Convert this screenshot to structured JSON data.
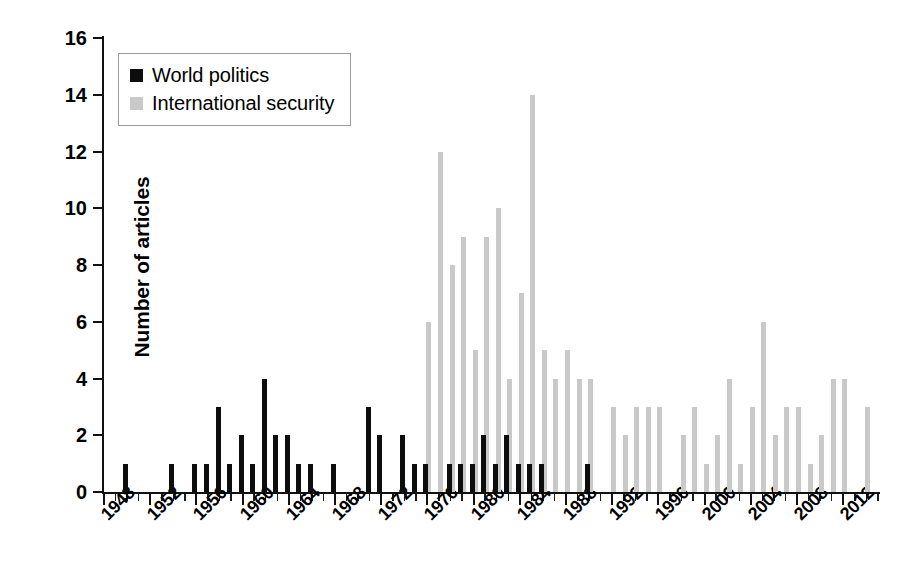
{
  "chart_data": {
    "type": "bar",
    "title": "",
    "xlabel": "",
    "ylabel": "Number of articles",
    "ylim": [
      0,
      16
    ],
    "ytick_values": [
      0,
      2,
      4,
      6,
      8,
      10,
      12,
      14,
      16
    ],
    "ytick_labels": [
      "0",
      "2",
      "4",
      "6",
      "8",
      "10",
      "12",
      "14",
      "16"
    ],
    "xlim": [
      1948,
      2015
    ],
    "xtick_labels": [
      "1948",
      "1952",
      "1956",
      "1960",
      "1964",
      "1968",
      "1972",
      "1976",
      "1980",
      "1984",
      "1988",
      "1992",
      "1996",
      "2000",
      "2004",
      "2008",
      "2012"
    ],
    "xtick_values": [
      1948,
      1952,
      1956,
      1960,
      1964,
      1968,
      1972,
      1976,
      1980,
      1984,
      1988,
      1992,
      1996,
      2000,
      2004,
      2008,
      2012
    ],
    "xtick_minor_step": 1,
    "grid": false,
    "legend_position": "upper-left-inside",
    "colors": {
      "world_politics": "#0d0d0d",
      "international_security": "#c9c9c9",
      "axis": "#111111",
      "background": "#ffffff"
    },
    "categories": [
      1948,
      1949,
      1950,
      1951,
      1952,
      1953,
      1954,
      1955,
      1956,
      1957,
      1958,
      1959,
      1960,
      1961,
      1962,
      1963,
      1964,
      1965,
      1966,
      1967,
      1968,
      1969,
      1970,
      1971,
      1972,
      1973,
      1974,
      1975,
      1976,
      1977,
      1978,
      1979,
      1980,
      1981,
      1982,
      1983,
      1984,
      1985,
      1986,
      1987,
      1988,
      1989,
      1990,
      1991,
      1992,
      1993,
      1994,
      1995,
      1996,
      1997,
      1998,
      1999,
      2000,
      2001,
      2002,
      2003,
      2004,
      2005,
      2006,
      2007,
      2008,
      2009,
      2010,
      2011,
      2012,
      2013,
      2014
    ],
    "series": [
      {
        "name": "World politics",
        "color": "#0d0d0d",
        "values": [
          0,
          0,
          1,
          0,
          0,
          0,
          1,
          0,
          1,
          1,
          3,
          1,
          2,
          1,
          4,
          2,
          2,
          1,
          1,
          0,
          1,
          0,
          0,
          3,
          2,
          0,
          2,
          1,
          1,
          0,
          1,
          1,
          1,
          2,
          1,
          2,
          1,
          1,
          1,
          0,
          0,
          0,
          1,
          0,
          0,
          0,
          0,
          0,
          0,
          0,
          0,
          0,
          0,
          0,
          0,
          0,
          0,
          0,
          0,
          0,
          0,
          0,
          0,
          0,
          0,
          0,
          0
        ]
      },
      {
        "name": "International security",
        "color": "#c9c9c9",
        "values": [
          0,
          0,
          0,
          0,
          0,
          0,
          0,
          0,
          0,
          0,
          0,
          0,
          0,
          0,
          0,
          0,
          0,
          0,
          0,
          0,
          0,
          0,
          0,
          0,
          0,
          0,
          0,
          0,
          6,
          12,
          8,
          9,
          5,
          9,
          10,
          4,
          7,
          14,
          5,
          4,
          5,
          4,
          4,
          0,
          3,
          2,
          3,
          3,
          3,
          0,
          2,
          3,
          1,
          2,
          4,
          1,
          3,
          6,
          2,
          3,
          3,
          1,
          2,
          4,
          4,
          0,
          3
        ]
      }
    ]
  },
  "legend": {
    "items": [
      {
        "label": "World politics",
        "swatch": "wp"
      },
      {
        "label": "International security",
        "swatch": "is"
      }
    ]
  },
  "axes": {
    "ylabel": "Number of articles"
  }
}
